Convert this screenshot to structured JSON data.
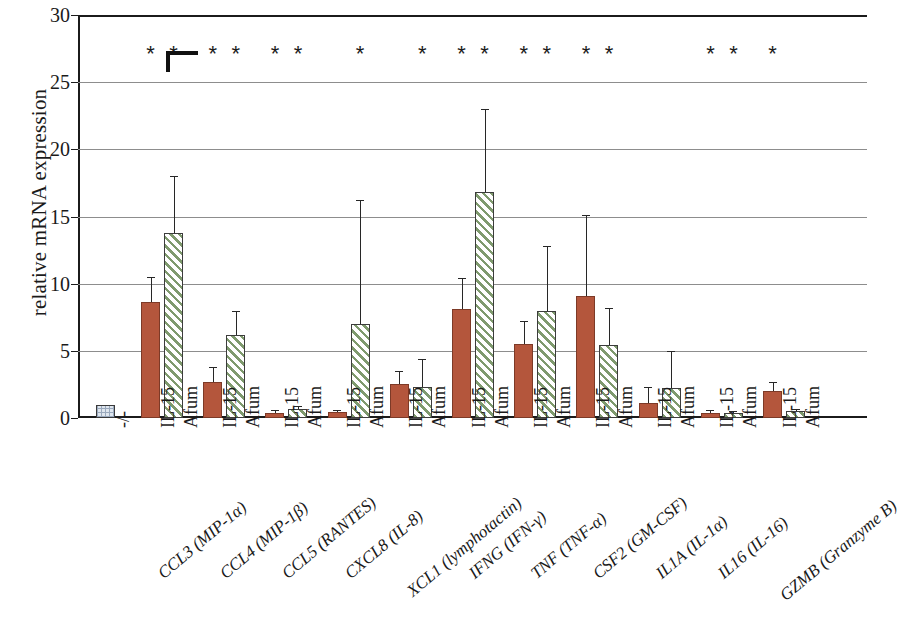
{
  "chart_data": {
    "type": "bar",
    "title": "",
    "xlabel": "",
    "ylabel": "relative mRNA expression",
    "ylim": [
      0,
      30
    ],
    "yticks": [
      0,
      5,
      10,
      15,
      20,
      25,
      30
    ],
    "grid": true,
    "legend_position": "none",
    "reference": {
      "label": "-/-",
      "value": 1.0,
      "error": 0.0,
      "style": "grid-filled"
    },
    "conditions": [
      "IL-15",
      "Afum"
    ],
    "categories": [
      "CCL3 (MIP-1α)",
      "CCL4 (MIP-1β)",
      "CCL5 (RANTES)",
      "CXCL8 (IL-8)",
      "XCL1 (lymphotactin)",
      "IFNG (IFN-γ)",
      "TNF (TNF-α)",
      "CSF2 (GM-CSF)",
      "IL1A (IL-1α)",
      "IL16 (IL-16)",
      "GZMB (Granzyme B)"
    ],
    "series": [
      {
        "name": "IL-15",
        "style": "solid",
        "color": "#b4563c",
        "values": [
          8.6,
          2.7,
          0.4,
          0.45,
          2.5,
          8.1,
          5.5,
          9.1,
          1.1,
          0.4,
          2.0
        ],
        "errors_upper": [
          10.5,
          3.8,
          0.6,
          0.6,
          3.5,
          10.4,
          7.2,
          15.1,
          2.3,
          0.6,
          2.7
        ],
        "significance": [
          "*",
          "*",
          "*",
          "",
          "",
          "*",
          "*",
          "*",
          "",
          "*",
          "*"
        ]
      },
      {
        "name": "Afum",
        "style": "hatched",
        "color": "#7f9a6e",
        "values": [
          13.8,
          6.2,
          0.7,
          7.0,
          2.3,
          16.8,
          8.0,
          5.4,
          2.2,
          0.35,
          0.5
        ],
        "errors_upper": [
          18.0,
          8.0,
          0.9,
          16.2,
          4.4,
          23.0,
          12.8,
          8.2,
          5.0,
          0.5,
          0.7
        ],
        "significance": [
          "*",
          "*",
          "*",
          "*",
          "*",
          "*",
          "*",
          "*",
          "",
          "*",
          ""
        ]
      }
    ]
  },
  "axis": {
    "y_title": "relative mRNA expression",
    "y_tick_labels": [
      "0",
      "5",
      "10",
      "15",
      "20",
      "25",
      "30"
    ]
  }
}
